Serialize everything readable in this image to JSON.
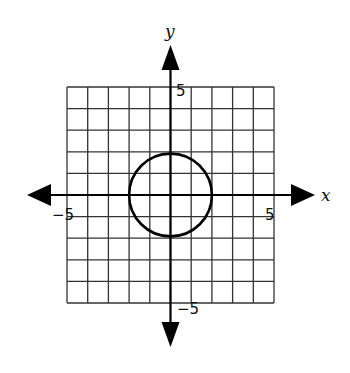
{
  "chart_data": {
    "type": "scatter",
    "title": "",
    "xlabel": "x",
    "ylabel": "y",
    "xlim": [
      -5,
      5
    ],
    "ylim": [
      -5,
      5
    ],
    "grid": true,
    "grid_step": 1,
    "tick_labels": {
      "x": [
        {
          "value": -5,
          "label": "−5"
        },
        {
          "value": 5,
          "label": "5"
        }
      ],
      "y": [
        {
          "value": 5,
          "label": "5"
        },
        {
          "value": -5,
          "label": "−5"
        }
      ]
    },
    "series": [
      {
        "name": "circle",
        "shape": "circle",
        "center": [
          0,
          0
        ],
        "radius": 2,
        "equation": "x^2 + y^2 = 4"
      }
    ],
    "axes_arrows": true,
    "legend": null
  },
  "labels": {
    "x_axis": "x",
    "y_axis": "y",
    "x_min": "−5",
    "x_max": "5",
    "y_max": "5",
    "y_min": "−5"
  },
  "colors": {
    "grid": "#333333",
    "axis": "#000000",
    "curve": "#000000",
    "background": "#ffffff"
  }
}
